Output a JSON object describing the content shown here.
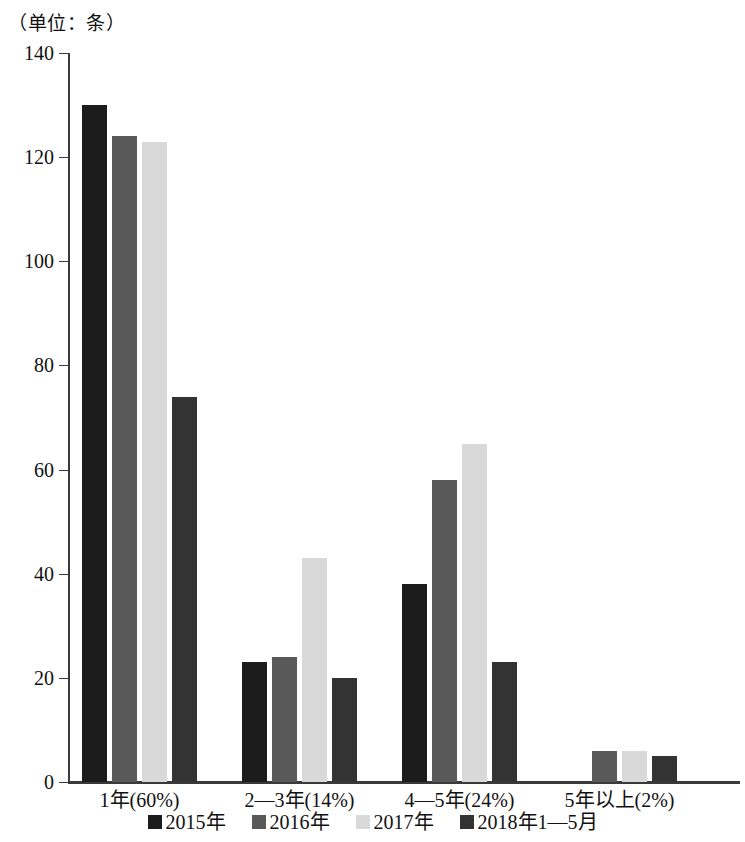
{
  "unit_caption": "（单位：条）",
  "chart_data": {
    "type": "bar",
    "title": "",
    "subtitle": "",
    "xlabel": "",
    "ylabel": "（单位：条）",
    "ylim": [
      0,
      140
    ],
    "yticks": [
      0,
      20,
      40,
      60,
      80,
      100,
      120,
      140
    ],
    "ytick_labels": [
      "0",
      "20",
      "40",
      "60",
      "80",
      "100",
      "120",
      "140"
    ],
    "grid": false,
    "legend_position": "bottom",
    "categories": [
      "1年(60%)",
      "2—3年(14%)",
      "4—5年(24%)",
      "5年以上(2%)"
    ],
    "series": [
      {
        "name": "2015年",
        "color": "#1c1c1c",
        "values": [
          130,
          23,
          38,
          0
        ]
      },
      {
        "name": "2016年",
        "color": "#595959",
        "values": [
          124,
          24,
          58,
          6
        ]
      },
      {
        "name": "2017年",
        "color": "#d9d9d9",
        "values": [
          123,
          43,
          65,
          6
        ]
      },
      {
        "name": "2018年1—5月",
        "color": "#333333",
        "values": [
          74,
          20,
          23,
          5
        ]
      }
    ]
  },
  "legend": [
    {
      "label": "2015年",
      "color": "#1c1c1c"
    },
    {
      "label": "2016年",
      "color": "#595959"
    },
    {
      "label": "2017年",
      "color": "#d9d9d9"
    },
    {
      "label": "2018年1—5月",
      "color": "#333333"
    }
  ]
}
